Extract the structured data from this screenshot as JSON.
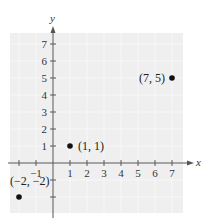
{
  "chart_data": {
    "type": "scatter",
    "title": "",
    "xlabel": "x",
    "ylabel": "y",
    "xlim": [
      -2.5,
      7.8
    ],
    "ylim": [
      -2.6,
      7.8
    ],
    "grid": true,
    "x_ticks": [
      -2,
      -1,
      1,
      2,
      3,
      4,
      5,
      6,
      7
    ],
    "x_tick_labels": [
      "",
      "-1",
      "1",
      "2",
      "3",
      "4",
      "5",
      "6",
      "7"
    ],
    "y_ticks": [
      -2,
      -1,
      1,
      2,
      3,
      4,
      5,
      6,
      7
    ],
    "y_tick_labels": [
      "",
      "",
      "1",
      "2",
      "3",
      "4",
      "5",
      "6",
      "7"
    ],
    "series": [
      {
        "name": "points",
        "points": [
          {
            "x": -2,
            "y": -2,
            "label": "(−2, −2)"
          },
          {
            "x": 1,
            "y": 1,
            "label": "(1, 1)"
          },
          {
            "x": 7,
            "y": 5,
            "label": "(7, 5)"
          }
        ]
      }
    ]
  },
  "colors": {
    "background_panel": "#efefef",
    "grid": "#f7f7f7",
    "axis": "#555555",
    "point": "#111111"
  }
}
